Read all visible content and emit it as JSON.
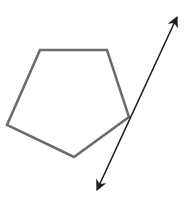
{
  "diagram": {
    "type": "geometry",
    "pentagon": {
      "vertices": [
        [
          40,
          50
        ],
        [
          107,
          50
        ],
        [
          129,
          117
        ],
        [
          74,
          157
        ],
        [
          7,
          125
        ]
      ],
      "stroke": "#6b6b6b",
      "stroke_width": 2.5
    },
    "line": {
      "start": [
        97,
        190
      ],
      "end": [
        177,
        17
      ],
      "stroke": "#1f1f1f",
      "stroke_width": 1.6,
      "arrows": "both"
    }
  }
}
